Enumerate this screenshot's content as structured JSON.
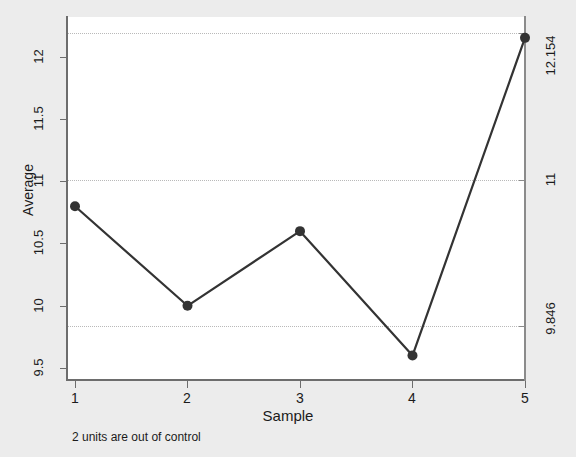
{
  "chart_data": {
    "type": "line",
    "title": "",
    "xlabel": "Sample",
    "ylabel": "Average",
    "x": [
      1,
      2,
      3,
      4,
      5
    ],
    "values": [
      10.8,
      10.0,
      10.6,
      9.6,
      12.154
    ],
    "categories": [
      "1",
      "2",
      "3",
      "4",
      "5"
    ],
    "xlim": [
      0.6,
      5.4
    ],
    "ylim": [
      9.4,
      12.25
    ],
    "xticks": [
      "1",
      "2",
      "3",
      "4",
      "5"
    ],
    "yticks": [
      "9.5",
      "10",
      "10.5",
      "11",
      "11.5",
      "12"
    ],
    "grid": false,
    "legend": "none",
    "series": [
      {
        "name": "Average",
        "values": [
          10.8,
          10.0,
          10.6,
          9.6,
          12.154
        ],
        "marker": "filled-circle",
        "color": "#333333"
      }
    ],
    "control_limits": {
      "upper": 12.154,
      "center": 11,
      "lower": 9.846,
      "upper_label": "12.154",
      "center_label": "11",
      "lower_label": "9.846",
      "line_color": "#b9b9b9",
      "line_style": "dotted"
    },
    "annotation": "2 units are out of control",
    "out_of_control_points": 2
  },
  "axes": {
    "y_title": "Average",
    "x_title": "Sample",
    "y_ticks": [
      {
        "label": "9.5",
        "value": 9.5
      },
      {
        "label": "10",
        "value": 10
      },
      {
        "label": "10.5",
        "value": 10.5
      },
      {
        "label": "11",
        "value": 11
      },
      {
        "label": "11.5",
        "value": 11.5
      },
      {
        "label": "12",
        "value": 12
      }
    ],
    "x_ticks": [
      {
        "label": "1",
        "value": 1
      },
      {
        "label": "2",
        "value": 2
      },
      {
        "label": "3",
        "value": 3
      },
      {
        "label": "4",
        "value": 4
      },
      {
        "label": "5",
        "value": 5
      }
    ],
    "right_ticks": [
      {
        "label": "12.154",
        "value": 12.154
      },
      {
        "label": "11",
        "value": 11
      },
      {
        "label": "9.846",
        "value": 9.846
      }
    ]
  },
  "footnote": {
    "text": "2 units are out of control"
  },
  "colors": {
    "background": "#ececec",
    "plot_background": "#ffffff",
    "axis": "#6d6d6d",
    "series": "#333333",
    "limit": "#b9b9b9"
  }
}
